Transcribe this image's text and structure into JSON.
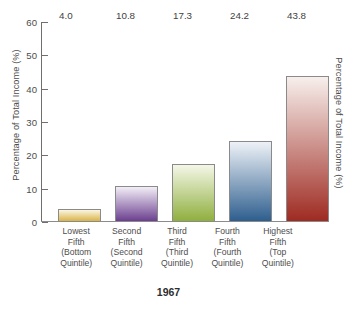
{
  "chart_data": {
    "type": "bar",
    "title": "",
    "subtitle": "",
    "xlabel": "",
    "ylabel": "Percentage of Total Income (%)",
    "ylabel_right": "Percentage of Total Income (%)",
    "year_label": "1967",
    "ylim": [
      0,
      60
    ],
    "ytick_step": 10,
    "yticks": [
      60,
      50,
      40,
      30,
      20,
      10,
      0
    ],
    "grid": false,
    "legend": "none",
    "categories": [
      "Lowest Fifth (Bottom Quintile)",
      "Second Fifth (Second Quintile)",
      "Third Fifth (Third Quintile)",
      "Fourth Fifth (Fourth Quintile)",
      "Highest Fifth (Top Quintile)"
    ],
    "category_lines": [
      [
        "Lowest",
        "Fifth",
        "(Bottom",
        "Quintile)"
      ],
      [
        "Second",
        "Fifth",
        "(Second",
        "Quintile)"
      ],
      [
        "Third",
        "Fifth",
        "(Third",
        "Quintile)"
      ],
      [
        "Fourth",
        "Fifth",
        "(Fourth",
        "Quintile)"
      ],
      [
        "Highest",
        "Fifth",
        "(Top",
        "Quintile)"
      ]
    ],
    "values": [
      4.0,
      10.8,
      17.3,
      24.2,
      43.8
    ],
    "value_labels": [
      "4.0",
      "10.8",
      "17.3",
      "24.2",
      "43.8"
    ],
    "bar_colors": [
      "#d9b44a",
      "#6b3f8f",
      "#8faf3e",
      "#2e5e8e",
      "#9e2b22"
    ],
    "bar_top_colors": [
      "#fbf6e2",
      "#f2eef6",
      "#f4f7e7",
      "#eef2f7",
      "#f7efec"
    ],
    "bar_border_color": "#8a8a8a",
    "axis_color": "#6f6f6f",
    "text_color": "#4d4d4d",
    "background": "#ffffff"
  }
}
